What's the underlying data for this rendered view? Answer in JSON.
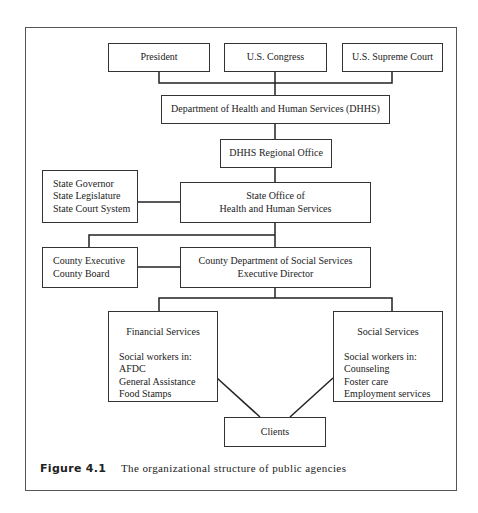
{
  "figure": {
    "number": "Figure 4.1",
    "caption": "The organizational structure of public agencies"
  },
  "nodes": {
    "president": {
      "lines": [
        "President"
      ]
    },
    "congress": {
      "lines": [
        "U.S. Congress"
      ]
    },
    "supreme_court": {
      "lines": [
        "U.S. Supreme Court"
      ]
    },
    "dhhs": {
      "lines": [
        "Department of Health and Human Services (DHHS)"
      ]
    },
    "regional_office": {
      "lines": [
        "DHHS Regional Office"
      ]
    },
    "state_gov": {
      "lines": [
        "State Governor",
        "State Legislature",
        "State Court System"
      ]
    },
    "state_office": {
      "lines": [
        "State Office of",
        "Health and Human Services"
      ]
    },
    "county_exec": {
      "lines": [
        "County Executive",
        "County Board"
      ]
    },
    "county_dept": {
      "lines": [
        "County Department of Social Services",
        "Executive Director"
      ]
    },
    "financial_services": {
      "title": "Financial Services",
      "lines": [
        "Social workers  in:",
        "AFDC",
        "General Assistance",
        "Food Stamps"
      ]
    },
    "social_services": {
      "title": "Social Services",
      "lines": [
        "Social workers  in:",
        "Counseling",
        "Foster care",
        "Employment services"
      ]
    },
    "clients": {
      "lines": [
        "Clients"
      ]
    }
  },
  "edges": [
    [
      "president",
      "dhhs"
    ],
    [
      "congress",
      "dhhs"
    ],
    [
      "supreme_court",
      "dhhs"
    ],
    [
      "dhhs",
      "regional_office"
    ],
    [
      "regional_office",
      "state_office"
    ],
    [
      "state_gov",
      "state_office"
    ],
    [
      "state_office",
      "county_exec"
    ],
    [
      "state_office",
      "county_dept"
    ],
    [
      "county_exec",
      "county_dept"
    ],
    [
      "county_dept",
      "financial_services"
    ],
    [
      "county_dept",
      "social_services"
    ],
    [
      "financial_services",
      "clients"
    ],
    [
      "social_services",
      "clients"
    ]
  ]
}
